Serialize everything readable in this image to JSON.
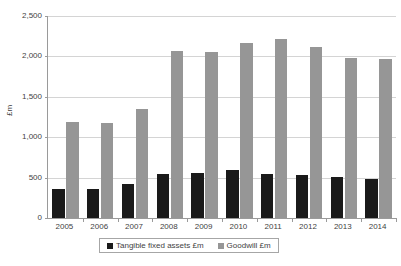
{
  "chart_data": {
    "type": "bar",
    "title": "",
    "xlabel": "",
    "ylabel": "£m",
    "categories": [
      "2005",
      "2006",
      "2007",
      "2008",
      "2009",
      "2010",
      "2011",
      "2012",
      "2013",
      "2014"
    ],
    "series": [
      {
        "name": "Tangible fixed assets £m",
        "color": "#1a1a1a",
        "values": [
          360,
          365,
          415,
          540,
          560,
          595,
          550,
          530,
          505,
          480
        ]
      },
      {
        "name": "Goodwill £m",
        "color": "#969696",
        "values": [
          1185,
          1180,
          1345,
          2065,
          2055,
          2160,
          2220,
          2120,
          1980,
          1965
        ]
      }
    ],
    "ylim": [
      0,
      2500
    ],
    "ytick_values": [
      0,
      500,
      1000,
      1500,
      2000,
      2500
    ],
    "ytick_labels": [
      "0",
      "500",
      "1,000",
      "1,500",
      "2,000",
      "2,500"
    ],
    "grid": true,
    "legend_position": "bottom"
  },
  "legend": {
    "items": [
      {
        "label": "Tangible fixed assets £m",
        "color": "#1a1a1a"
      },
      {
        "label": "Goodwill £m",
        "color": "#969696"
      }
    ]
  },
  "colors": {
    "tangible": "#1a1a1a",
    "goodwill": "#969696",
    "gridline": "#d4d4d4",
    "axis": "#9a9a9a",
    "text": "#3f3f3f",
    "background": "#ffffff"
  }
}
